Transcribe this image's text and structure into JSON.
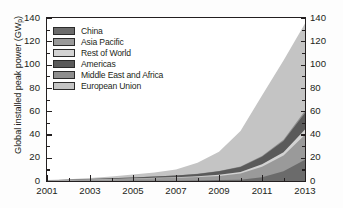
{
  "chart_data": {
    "type": "area",
    "stacked": true,
    "title": "",
    "xlabel": "",
    "ylabel": "Global installed peak power (GWp)",
    "ylabel_text": "Global installed peak power (GW",
    "ylabel_sub": "p",
    "ylabel_tail": ")",
    "xlim": [
      2001,
      2013
    ],
    "ylim": [
      0,
      140
    ],
    "ytick_step": 20,
    "yminor_step": 10,
    "grid": false,
    "legend_position": "top-left",
    "xtick_labels": [
      "2001",
      "2003",
      "2005",
      "2007",
      "2009",
      "2011",
      "2013"
    ],
    "xtick_values": [
      2001,
      2003,
      2005,
      2007,
      2009,
      2011,
      2013
    ],
    "ytick_labels": [
      "0",
      "20",
      "40",
      "60",
      "80",
      "100",
      "120",
      "140"
    ],
    "ytick_values": [
      0,
      20,
      40,
      60,
      80,
      100,
      120,
      140
    ],
    "x": [
      2001,
      2002,
      2003,
      2004,
      2005,
      2006,
      2007,
      2008,
      2009,
      2010,
      2011,
      2012,
      2013
    ],
    "series": [
      {
        "name": "China",
        "color": "#6b6b6b",
        "values": [
          0.02,
          0.04,
          0.06,
          0.1,
          0.15,
          0.2,
          0.3,
          0.5,
          0.8,
          1.0,
          3.3,
          8.3,
          18.3
        ]
      },
      {
        "name": "Asia Pacific",
        "color": "#9a9a9a",
        "values": [
          0.4,
          0.7,
          1.1,
          1.5,
          1.9,
          2.2,
          2.5,
          2.9,
          3.6,
          5.4,
          9.0,
          13.5,
          21.5
        ]
      },
      {
        "name": "Rest of World",
        "color": "#d3d3d3",
        "values": [
          0.03,
          0.05,
          0.08,
          0.12,
          0.2,
          0.3,
          0.4,
          0.6,
          0.9,
          1.3,
          2.0,
          3.0,
          4.5
        ]
      },
      {
        "name": "Americas",
        "color": "#5a5a5a",
        "values": [
          0.2,
          0.3,
          0.4,
          0.6,
          0.8,
          1.1,
          1.5,
          2.1,
          3.0,
          4.4,
          6.5,
          9.5,
          14.0
        ]
      },
      {
        "name": "Middle East and Africa",
        "color": "#8e8e8e",
        "values": [
          0.01,
          0.02,
          0.03,
          0.04,
          0.06,
          0.08,
          0.1,
          0.15,
          0.25,
          0.4,
          0.7,
          1.2,
          2.0
        ]
      },
      {
        "name": "European Union",
        "color": "#c4c4c4",
        "values": [
          0.3,
          0.5,
          0.9,
          1.6,
          2.5,
          3.5,
          5.0,
          9.5,
          16.5,
          30.5,
          52.0,
          68.0,
          75.0
        ]
      }
    ],
    "totals": [
      0.96,
      1.61,
      2.57,
      3.96,
      5.61,
      7.38,
      9.8,
      15.75,
      25.05,
      43.0,
      73.5,
      103.5,
      135.3
    ]
  }
}
